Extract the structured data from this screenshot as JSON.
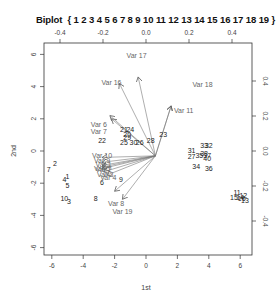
{
  "chart_data": {
    "type": "scatter",
    "subtype": "biplot",
    "title": "Biplot",
    "subtitle": "{ 1 2 3 4 5 6 7 8 9 10 11 12 13 14 15 16 17 18 19 }",
    "xlabel": "1st",
    "ylabel": "2nd",
    "xlim": [
      -6.5,
      6.7
    ],
    "ylim": [
      -6.5,
      6.8
    ],
    "x_ticks": [
      -6,
      -4,
      -2,
      0,
      2,
      4,
      6
    ],
    "y_ticks": [
      -6,
      -4,
      -2,
      0,
      2,
      4,
      6
    ],
    "top_ticks": [
      -0.4,
      -0.2,
      0.0,
      0.2,
      0.4
    ],
    "right_ticks": [
      -0.4,
      -0.2,
      0.0,
      0.2,
      0.4
    ],
    "grid": false,
    "legend": null,
    "observations": [
      {
        "label": "1",
        "x": -5.0,
        "y": -1.6
      },
      {
        "label": "2",
        "x": -5.8,
        "y": -0.8
      },
      {
        "label": "3",
        "x": -4.9,
        "y": -3.2
      },
      {
        "label": "4",
        "x": -5.2,
        "y": -1.8
      },
      {
        "label": "5",
        "x": -5.0,
        "y": -2.2
      },
      {
        "label": "6",
        "x": -2.8,
        "y": -2.0
      },
      {
        "label": "7",
        "x": -6.2,
        "y": -1.2
      },
      {
        "label": "8",
        "x": -3.2,
        "y": -3.0
      },
      {
        "label": "9",
        "x": -1.6,
        "y": -1.8
      },
      {
        "label": "10",
        "x": -5.2,
        "y": -3.0
      },
      {
        "label": "11",
        "x": 5.8,
        "y": -2.6
      },
      {
        "label": "12",
        "x": 6.2,
        "y": -2.8
      },
      {
        "label": "13",
        "x": 6.3,
        "y": -3.1
      },
      {
        "label": "14",
        "x": 6.0,
        "y": -2.9
      },
      {
        "label": "15",
        "x": 5.6,
        "y": -2.9
      },
      {
        "label": "16",
        "x": 6.1,
        "y": -3.0
      },
      {
        "label": "20",
        "x": -1.2,
        "y": 1.0
      },
      {
        "label": "21",
        "x": -1.4,
        "y": 1.3
      },
      {
        "label": "22",
        "x": -2.8,
        "y": 0.6
      },
      {
        "label": "23",
        "x": 1.1,
        "y": 1.0
      },
      {
        "label": "24",
        "x": -1.0,
        "y": 1.3
      },
      {
        "label": "25",
        "x": -1.4,
        "y": 0.5
      },
      {
        "label": "26",
        "x": -0.4,
        "y": 0.5
      },
      {
        "label": "27",
        "x": 2.9,
        "y": -0.4
      },
      {
        "label": "28",
        "x": 0.3,
        "y": 0.6
      },
      {
        "label": "29",
        "x": -1.2,
        "y": 0.8
      },
      {
        "label": "30",
        "x": -0.8,
        "y": 0.5
      },
      {
        "label": "31",
        "x": 2.9,
        "y": 0.0
      },
      {
        "label": "32",
        "x": 4.0,
        "y": 0.3
      },
      {
        "label": "33",
        "x": 3.7,
        "y": 0.3
      },
      {
        "label": "34",
        "x": 3.2,
        "y": -1.0
      },
      {
        "label": "35",
        "x": 3.4,
        "y": -0.3
      },
      {
        "label": "36",
        "x": 4.0,
        "y": -1.1
      },
      {
        "label": "37",
        "x": 3.9,
        "y": -0.3
      },
      {
        "label": "38",
        "x": 3.7,
        "y": -0.2
      },
      {
        "label": "40",
        "x": 3.9,
        "y": -0.5
      }
    ],
    "variables": [
      {
        "label": "Var 17",
        "x": -0.5,
        "y": 4.6,
        "label_x": -0.6,
        "label_y": 5.9
      },
      {
        "label": "Var 16",
        "x": -1.7,
        "y": 4.2,
        "label_x": -2.2,
        "label_y": 4.2
      },
      {
        "label": "Var 18",
        "x": 1.6,
        "y": 2.8,
        "label_x": 3.6,
        "label_y": 4.1
      },
      {
        "label": "Var 11",
        "x": 1.6,
        "y": 2.8,
        "label_x": 2.4,
        "label_y": 2.5
      },
      {
        "label": "Var 6",
        "x": -2.2,
        "y": 2.0,
        "label_x": -3.0,
        "label_y": 1.6
      },
      {
        "label": "Var 7",
        "x": -2.3,
        "y": 2.2,
        "label_x": -3.0,
        "label_y": 1.2
      },
      {
        "label": "Var 19",
        "x": -1.5,
        "y": -3.0,
        "label_x": -1.5,
        "label_y": -3.8
      },
      {
        "label": "Var 8",
        "x": -2.0,
        "y": -2.5,
        "label_x": -1.9,
        "label_y": -3.3
      },
      {
        "label": "Var 10",
        "x": -2.8,
        "y": -0.4,
        "label_x": -2.8,
        "label_y": -0.3
      },
      {
        "label": "Var 9",
        "x": -2.8,
        "y": -0.7,
        "label_x": -2.8,
        "label_y": -0.6
      },
      {
        "label": "Var 1",
        "x": -2.8,
        "y": -0.9,
        "label_x": -2.7,
        "label_y": -0.9
      },
      {
        "label": "Var 2",
        "x": -2.8,
        "y": -1.1,
        "label_x": -2.7,
        "label_y": -1.2
      },
      {
        "label": "Var 3",
        "x": -2.7,
        "y": -1.3,
        "label_x": -2.6,
        "label_y": -1.5
      },
      {
        "label": "Var 4",
        "x": -2.5,
        "y": -1.5,
        "label_x": -2.4,
        "label_y": -1.7
      },
      {
        "label": "Var 5",
        "x": -2.8,
        "y": -1.0,
        "label_x": -2.8,
        "label_y": -1.1
      }
    ]
  }
}
